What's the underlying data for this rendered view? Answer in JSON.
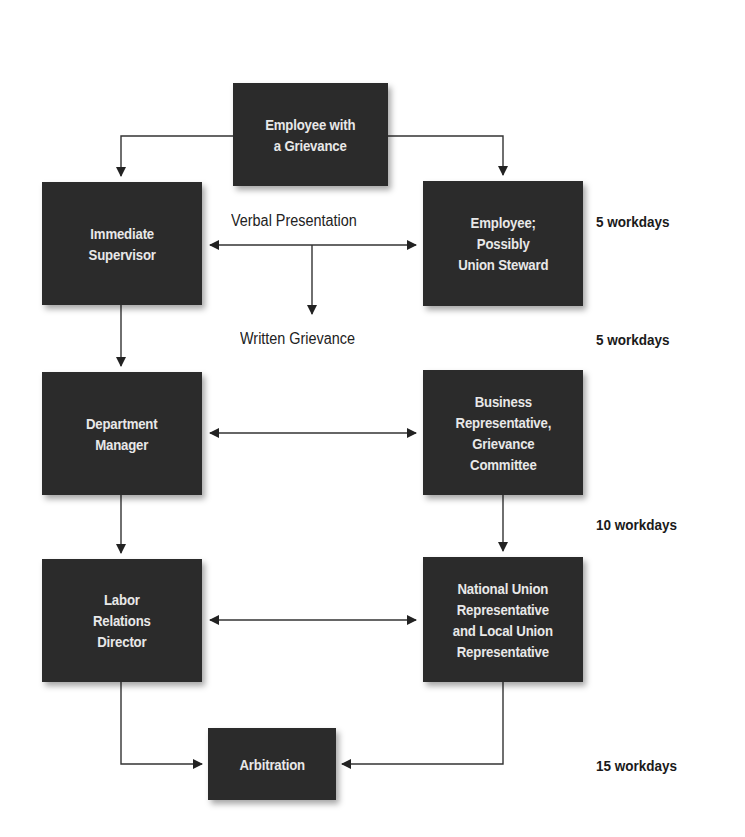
{
  "diagram": {
    "nodes": {
      "employee_grievance": "Employee with\na Grievance",
      "immediate_supervisor": "Immediate\nSupervisor",
      "employee_steward": "Employee;\nPossibly\nUnion Steward",
      "department_manager": "Department\nManager",
      "business_rep": "Business\nRepresentative,\nGrievance\nCommittee",
      "labor_relations": "Labor\nRelations\nDirector",
      "national_union": "National Union\nRepresentative\nand Local Union\nRepresentative",
      "arbitration": "Arbitration"
    },
    "stage_labels": {
      "verbal": "Verbal Presentation",
      "written": "Written Grievance"
    },
    "time_limits": {
      "step1": "5 workdays",
      "step2": "5 workdays",
      "step3": "10 workdays",
      "step4": "15 workdays"
    },
    "colors": {
      "box_fill": "#2b2b2b",
      "box_text": "#e8e8e8",
      "line": "#222222"
    }
  }
}
